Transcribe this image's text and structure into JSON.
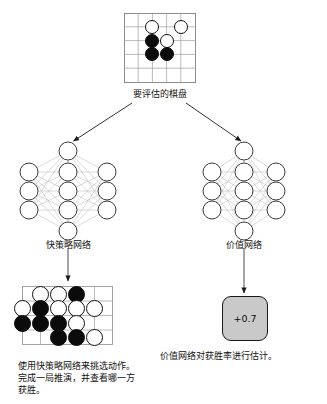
{
  "diagram": {
    "title_caption": "要评估的棋盘",
    "boards": {
      "evaluate": {
        "name": "要评估的棋盘",
        "size": 5,
        "caption": "要评估的棋盘",
        "stones": [
          {
            "col": 2,
            "row": 1,
            "color": "white"
          },
          {
            "col": 4,
            "row": 1,
            "color": "white"
          },
          {
            "col": 2,
            "row": 2,
            "color": "black"
          },
          {
            "col": 3,
            "row": 2,
            "color": "white"
          },
          {
            "col": 2,
            "row": 3,
            "color": "black"
          },
          {
            "col": 3,
            "row": 3,
            "color": "black"
          }
        ]
      },
      "rollout": {
        "name": "推演棋盘",
        "size": 5,
        "stones": [
          {
            "col": 1,
            "row": 0,
            "color": "white"
          },
          {
            "col": 2,
            "row": 0,
            "color": "white"
          },
          {
            "col": 3,
            "row": 0,
            "color": "black"
          },
          {
            "col": 0,
            "row": 1,
            "color": "white"
          },
          {
            "col": 1,
            "row": 1,
            "color": "black"
          },
          {
            "col": 2,
            "row": 1,
            "color": "white"
          },
          {
            "col": 3,
            "row": 1,
            "color": "white"
          },
          {
            "col": 4,
            "row": 1,
            "color": "white"
          },
          {
            "col": 0,
            "row": 2,
            "color": "black"
          },
          {
            "col": 1,
            "row": 2,
            "color": "black"
          },
          {
            "col": 2,
            "row": 2,
            "color": "black"
          },
          {
            "col": 3,
            "row": 2,
            "color": "white"
          },
          {
            "col": 2,
            "row": 3,
            "color": "black"
          },
          {
            "col": 3,
            "row": 3,
            "color": "black"
          },
          {
            "col": 4,
            "row": 3,
            "color": "white"
          }
        ]
      }
    },
    "networks": {
      "policy": {
        "label": "快策略网络",
        "layers": [
          1,
          3,
          5,
          3,
          1
        ]
      },
      "value": {
        "label": "价值网络",
        "layers": [
          1,
          3,
          5,
          3,
          1
        ]
      }
    },
    "value_output": {
      "value": "+0.7",
      "caption": "价值网络对获胜率进行估计。"
    },
    "policy_output": {
      "caption": "使用快策略网络来挑选动作。\n完成一局推演，并查看哪一方\n获胜。"
    },
    "colors": {
      "stone_black": "#0b0b0b",
      "stone_white": "#ffffff",
      "grid_line": "#9a9a9a",
      "board_border": "#8c8c8c",
      "arrow": "#1a1a1a",
      "network_edge": "#b2b2b2",
      "node_stroke": "#3a3a3a",
      "value_box_fill": "#c9c9c9"
    }
  }
}
